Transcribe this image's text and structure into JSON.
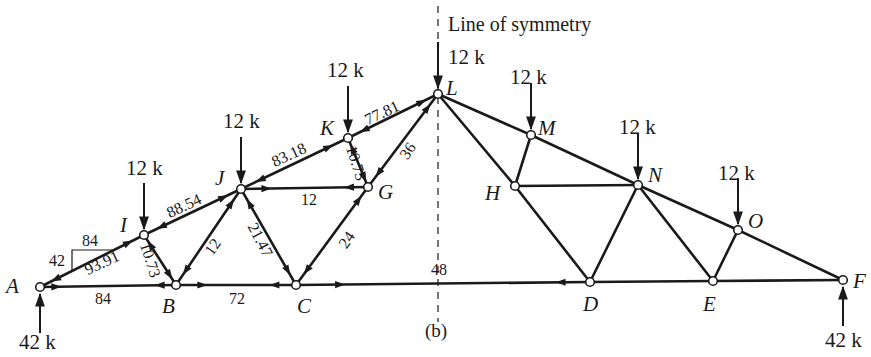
{
  "diagram": {
    "caption": "(b)",
    "symmetry_label": "Line of symmetry",
    "colors": {
      "ink": "#1a1a1a",
      "background": "#ffffff"
    },
    "nodes": [
      {
        "id": "A",
        "x": 40,
        "y": 287
      },
      {
        "id": "B",
        "x": 176,
        "y": 285
      },
      {
        "id": "C",
        "x": 296,
        "y": 285
      },
      {
        "id": "D",
        "x": 590,
        "y": 282
      },
      {
        "id": "E",
        "x": 713,
        "y": 281
      },
      {
        "id": "F",
        "x": 843,
        "y": 280
      },
      {
        "id": "I",
        "x": 144,
        "y": 235
      },
      {
        "id": "J",
        "x": 241,
        "y": 189
      },
      {
        "id": "K",
        "x": 348,
        "y": 138
      },
      {
        "id": "L",
        "x": 438,
        "y": 94
      },
      {
        "id": "G",
        "x": 368,
        "y": 187
      },
      {
        "id": "H",
        "x": 515,
        "y": 186
      },
      {
        "id": "M",
        "x": 531,
        "y": 135
      },
      {
        "id": "N",
        "x": 638,
        "y": 185
      },
      {
        "id": "O",
        "x": 738,
        "y": 230
      }
    ],
    "node_labels": {
      "A": "A",
      "B": "B",
      "C": "C",
      "D": "D",
      "E": "E",
      "F": "F",
      "G": "G",
      "H": "H",
      "I": "I",
      "J": "J",
      "K": "K",
      "L": "L",
      "M": "M",
      "N": "N",
      "O": "O"
    },
    "members": [
      {
        "from": "A",
        "to": "B",
        "force": "84"
      },
      {
        "from": "B",
        "to": "C",
        "force": "72"
      },
      {
        "from": "C",
        "to": "D",
        "force": "48"
      },
      {
        "from": "D",
        "to": "E",
        "force": ""
      },
      {
        "from": "E",
        "to": "F",
        "force": ""
      },
      {
        "from": "A",
        "to": "I",
        "force": "93.91"
      },
      {
        "from": "I",
        "to": "J",
        "force": "88.54"
      },
      {
        "from": "J",
        "to": "K",
        "force": "83.18"
      },
      {
        "from": "K",
        "to": "L",
        "force": "77.81"
      },
      {
        "from": "L",
        "to": "M",
        "force": ""
      },
      {
        "from": "M",
        "to": "N",
        "force": ""
      },
      {
        "from": "N",
        "to": "O",
        "force": ""
      },
      {
        "from": "O",
        "to": "F",
        "force": ""
      },
      {
        "from": "I",
        "to": "B",
        "force": "10.73"
      },
      {
        "from": "B",
        "to": "J",
        "force": "12"
      },
      {
        "from": "J",
        "to": "C",
        "force": "21.47"
      },
      {
        "from": "J",
        "to": "G",
        "force": "12"
      },
      {
        "from": "C",
        "to": "G",
        "force": "24"
      },
      {
        "from": "K",
        "to": "G",
        "force": "10.73"
      },
      {
        "from": "G",
        "to": "L",
        "force": "36"
      },
      {
        "from": "L",
        "to": "H",
        "force": ""
      },
      {
        "from": "H",
        "to": "M",
        "force": ""
      },
      {
        "from": "H",
        "to": "N",
        "force": ""
      },
      {
        "from": "H",
        "to": "D",
        "force": ""
      },
      {
        "from": "D",
        "to": "N",
        "force": ""
      },
      {
        "from": "N",
        "to": "E",
        "force": ""
      },
      {
        "from": "E",
        "to": "O",
        "force": ""
      }
    ],
    "force_labels": {
      "AB": "84",
      "BC": "72",
      "CD": "48",
      "AI": "93.91",
      "IJ": "88.54",
      "JK": "83.18",
      "KL": "77.81",
      "IB": "10.73",
      "BJ": "12",
      "JC": "21.47",
      "JG": "12",
      "CG": "24",
      "KG": "10.73",
      "GL": "36",
      "comp_h": "84",
      "comp_v": "42"
    },
    "loads": [
      {
        "node": "I",
        "label": "12 k"
      },
      {
        "node": "J",
        "label": "12 k"
      },
      {
        "node": "K",
        "label": "12 k"
      },
      {
        "node": "L",
        "label": "12 k"
      },
      {
        "node": "M",
        "label": "12 k"
      },
      {
        "node": "N",
        "label": "12 k"
      },
      {
        "node": "O",
        "label": "12 k"
      }
    ],
    "load_labels": {
      "I": "12 k",
      "J": "12 k",
      "K": "12 k",
      "L": "12 k",
      "M": "12 k",
      "N": "12 k",
      "O": "12 k"
    },
    "reactions": [
      {
        "node": "A",
        "label": "42 k"
      },
      {
        "node": "F",
        "label": "42 k"
      }
    ],
    "reaction_labels": {
      "A": "42 k",
      "F": "42 k"
    }
  }
}
